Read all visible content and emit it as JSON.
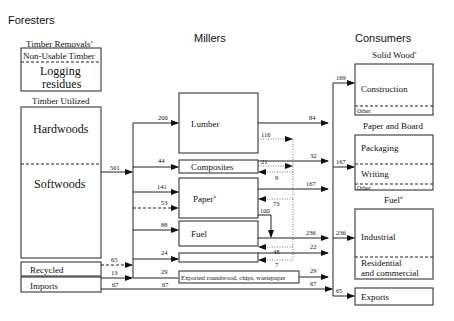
{
  "columns": {
    "foresters": "Foresters",
    "millers": "Millers",
    "consumers": "Consumers"
  },
  "foresters": {
    "timber_removals_label": "Timber Removals",
    "timber_removals_note": "a",
    "non_usable_label": "Non-Usable Timber",
    "logging_residues_line1": "Logging",
    "logging_residues_line2": "residues",
    "timber_utilized_label": "Timber Utilized",
    "hardwoods": "Hardwoods",
    "softwoods": "Softwoods",
    "recycled": "Recycled",
    "imports": "Imports"
  },
  "millers": {
    "lumber": "Lumber",
    "composites": "Composites",
    "paper": "Paper",
    "paper_note": "b",
    "fuel": "Fuel",
    "exported": "Exported roundwood, chips, wastepaper"
  },
  "consumers": {
    "solid_wood_label": "Solid Wood",
    "solid_wood_note": "c",
    "construction": "Construction",
    "solid_other": "Other",
    "paper_board_label": "Paper and Board",
    "packaging": "Packaging",
    "writing": "Writing",
    "paper_other": "Other",
    "fuel_label": "Fuel",
    "fuel_note": "d",
    "industrial": "Industrial",
    "residential_line1": "Residential",
    "residential_line2": "and commercial",
    "exports": "Exports"
  },
  "flows": {
    "timber_utilized_to_millers": "501",
    "to_lumber": "200",
    "to_composites": "44",
    "to_paper": "141",
    "to_paper_recycled": "53",
    "to_fuel": "88",
    "to_small_box": "24",
    "recycled_in": "65",
    "imports_to_millers": "13",
    "to_exported": "29",
    "imports_direct": "67",
    "imports_direct_2": "67",
    "lumber_residue": "116",
    "lumber_out": "84",
    "composites_in_residue": "21",
    "composites_back": "9",
    "composites_out": "32",
    "paper_back": "73",
    "paper_out": "167",
    "paper_to_fuel": "100",
    "fuel_out": "236",
    "fuel_back": "48",
    "small_back": "7",
    "small_out": "22",
    "exported_out": "29",
    "imports_out": "67",
    "to_construction": "169",
    "to_paper_board": "167",
    "to_fuel_consumers": "236",
    "to_exports": "65"
  }
}
